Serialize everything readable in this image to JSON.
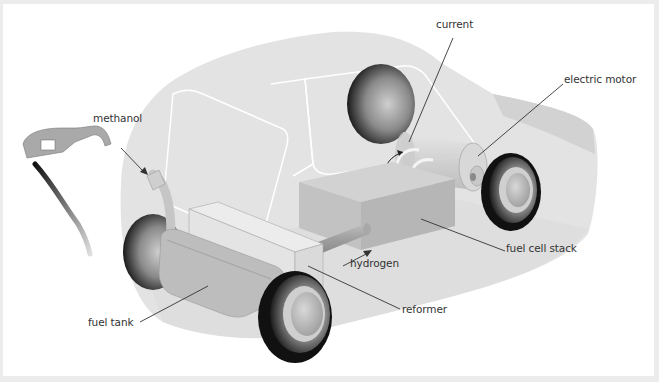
{
  "diagram": {
    "labels": [
      {
        "id": "current",
        "text": "current",
        "x": 436,
        "y": 18
      },
      {
        "id": "electric-motor",
        "text": "electric motor",
        "x": 563,
        "y": 73
      },
      {
        "id": "methanol",
        "text": "methanol",
        "x": 92,
        "y": 111
      },
      {
        "id": "fuel-cell-stack",
        "text": "fuel cell stack",
        "x": 506,
        "y": 242
      },
      {
        "id": "hydrogen",
        "text": "hydrogen",
        "x": 350,
        "y": 257
      },
      {
        "id": "reformer",
        "text": "reformer",
        "x": 401,
        "y": 302
      },
      {
        "id": "fuel-tank",
        "text": "fuel tank",
        "x": 87,
        "y": 316
      }
    ],
    "colors": {
      "body": "#e3e3e3",
      "body_shadow": "#d2d2d2",
      "window_edge": "#ffffff",
      "box_top": "#d6d6d6",
      "box_front": "#c2c2c2",
      "box_side": "#b4b4b4",
      "tire": "#111111",
      "leader_line": "#333333",
      "background": "#ffffff",
      "frame": "#ececec"
    }
  }
}
